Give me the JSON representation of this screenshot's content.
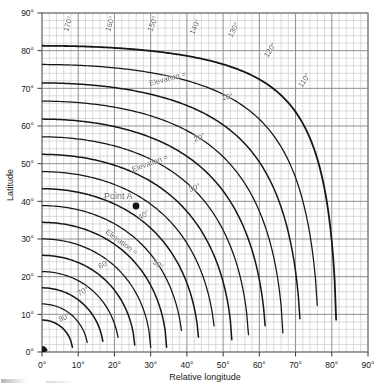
{
  "chart_data": {
    "type": "line",
    "title": "",
    "xlabel": "Relative longitude",
    "ylabel": "Latitude",
    "xlim": [
      0,
      90
    ],
    "ylim": [
      0,
      90
    ],
    "xticks": [
      "0°",
      "10°",
      "20°",
      "30°",
      "40°",
      "50°",
      "60°",
      "70°",
      "80°",
      "90°"
    ],
    "yticks": [
      "0°",
      "10°",
      "20°",
      "30°",
      "40°",
      "50°",
      "60°",
      "70°",
      "80°",
      "90°"
    ],
    "xtick_values": [
      0,
      10,
      20,
      30,
      40,
      50,
      60,
      70,
      80,
      90
    ],
    "ytick_values": [
      0,
      10,
      20,
      30,
      40,
      50,
      60,
      70,
      80,
      90
    ],
    "grid": true,
    "grid_minor_step": 2,
    "grid_major_step": 10,
    "legend": "none",
    "elevation_contours": {
      "label_prefix": "Elevation =",
      "values": [
        0,
        10,
        20,
        30,
        40,
        50,
        60,
        70,
        80
      ],
      "labels": [
        "Elevation = 10°",
        "20°",
        "Elevation = 30°",
        "40°",
        "Elevation = 50°",
        "60°",
        "70°",
        "80°"
      ]
    },
    "azimuth_contours": {
      "values": [
        110,
        120,
        130,
        140,
        150,
        160,
        170
      ],
      "labels": [
        "110°",
        "120°",
        "130°",
        "140°",
        "150°",
        "160°",
        "170°"
      ]
    },
    "annotations": [
      {
        "text": "Point A",
        "x": 24,
        "y": 39.5,
        "marker": "filled-dot"
      }
    ]
  },
  "axes": {
    "y_title": "Latitude",
    "x_title": "Relative longitude",
    "x_ticks": [
      "0°",
      "10°",
      "20°",
      "30°",
      "40°",
      "50°",
      "60°",
      "70°",
      "80°",
      "90°"
    ],
    "y_ticks": [
      "90°",
      "80°",
      "70°",
      "60°",
      "50°",
      "40°",
      "30°",
      "20°",
      "10°",
      "0°"
    ]
  },
  "labels": {
    "elev10": "Elevation =",
    "elev10_val": "10°",
    "elev20": "20°",
    "elev30": "Elevation =",
    "elev30_val": "30°",
    "elev40": "40°",
    "elev50": "Elevation =",
    "elev50_val": "50°",
    "elev60": "60°",
    "elev70": "70°",
    "elev80": "80°",
    "lon110": "110°",
    "lon120": "120°",
    "lon130": "130°",
    "lon140": "140°",
    "lon150": "150°",
    "lon160": "160°",
    "lon170": "170°",
    "point_a": "Point A"
  },
  "colors": {
    "curve": "#161616",
    "grid_minor": "#bdbdbd",
    "grid_major": "#8a8a8a",
    "frame": "#7c7c7c",
    "text": "#111111",
    "background": "#ffffff"
  }
}
